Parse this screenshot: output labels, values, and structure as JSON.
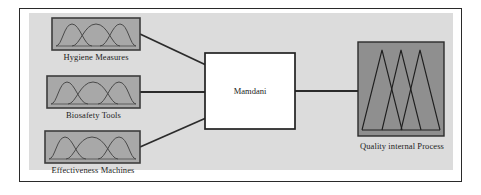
{
  "diagram": {
    "type": "fuzzy-inference-block-diagram",
    "frame": {
      "border_color": "#2a2a2a",
      "panel_color": "#dcdcdc",
      "page_color": "#ffffff"
    },
    "inputs": [
      {
        "id": "input-1",
        "label": "Hygiene Measures",
        "membership_shape": "bell",
        "membership_count": 3,
        "fill_color": "#a8a8a8",
        "stroke_color": "#3c3c3c",
        "box": {
          "x": 52,
          "y": 18,
          "w": 88,
          "h": 32
        },
        "label_pos": {
          "x": 52,
          "y": 52,
          "w": 88
        }
      },
      {
        "id": "input-2",
        "label": "Biosafety Tools",
        "membership_shape": "bell",
        "membership_count": 3,
        "fill_color": "#a8a8a8",
        "stroke_color": "#3c3c3c",
        "box": {
          "x": 47,
          "y": 76,
          "w": 93,
          "h": 32
        },
        "label_pos": {
          "x": 47,
          "y": 110,
          "w": 93
        }
      },
      {
        "id": "input-3",
        "label": "Effectiveness Machines",
        "membership_shape": "bell",
        "membership_count": 3,
        "fill_color": "#a8a8a8",
        "stroke_color": "#3c3c3c",
        "box": {
          "x": 45,
          "y": 131,
          "w": 95,
          "h": 32
        },
        "label_pos": {
          "x": 38,
          "y": 165,
          "w": 110
        }
      }
    ],
    "engine": {
      "id": "inference-engine",
      "label": "Mamdani",
      "fill_color": "#ffffff",
      "stroke_color": "#222222",
      "box": {
        "x": 205,
        "y": 53,
        "w": 90,
        "h": 76
      }
    },
    "output": {
      "id": "output-1",
      "label": "Quality internal Process",
      "membership_shape": "triangle",
      "membership_count": 3,
      "fill_color": "#8f8f8f",
      "stroke_color": "#2b2b2b",
      "box": {
        "x": 358,
        "y": 42,
        "w": 86,
        "h": 94
      },
      "label_pos": {
        "x": 352,
        "y": 141,
        "w": 100
      }
    },
    "connectors": [
      {
        "id": "conn-input1-engine",
        "from": "input-1",
        "to": "inference-engine",
        "style": "diagonal-down"
      },
      {
        "id": "conn-input2-engine",
        "from": "input-2",
        "to": "inference-engine",
        "style": "horizontal"
      },
      {
        "id": "conn-input3-engine",
        "from": "input-3",
        "to": "inference-engine",
        "style": "diagonal-up"
      },
      {
        "id": "conn-engine-output",
        "from": "inference-engine",
        "to": "output-1",
        "style": "horizontal"
      }
    ],
    "line_color": "#2b2b2b",
    "line_width": 1.6
  }
}
